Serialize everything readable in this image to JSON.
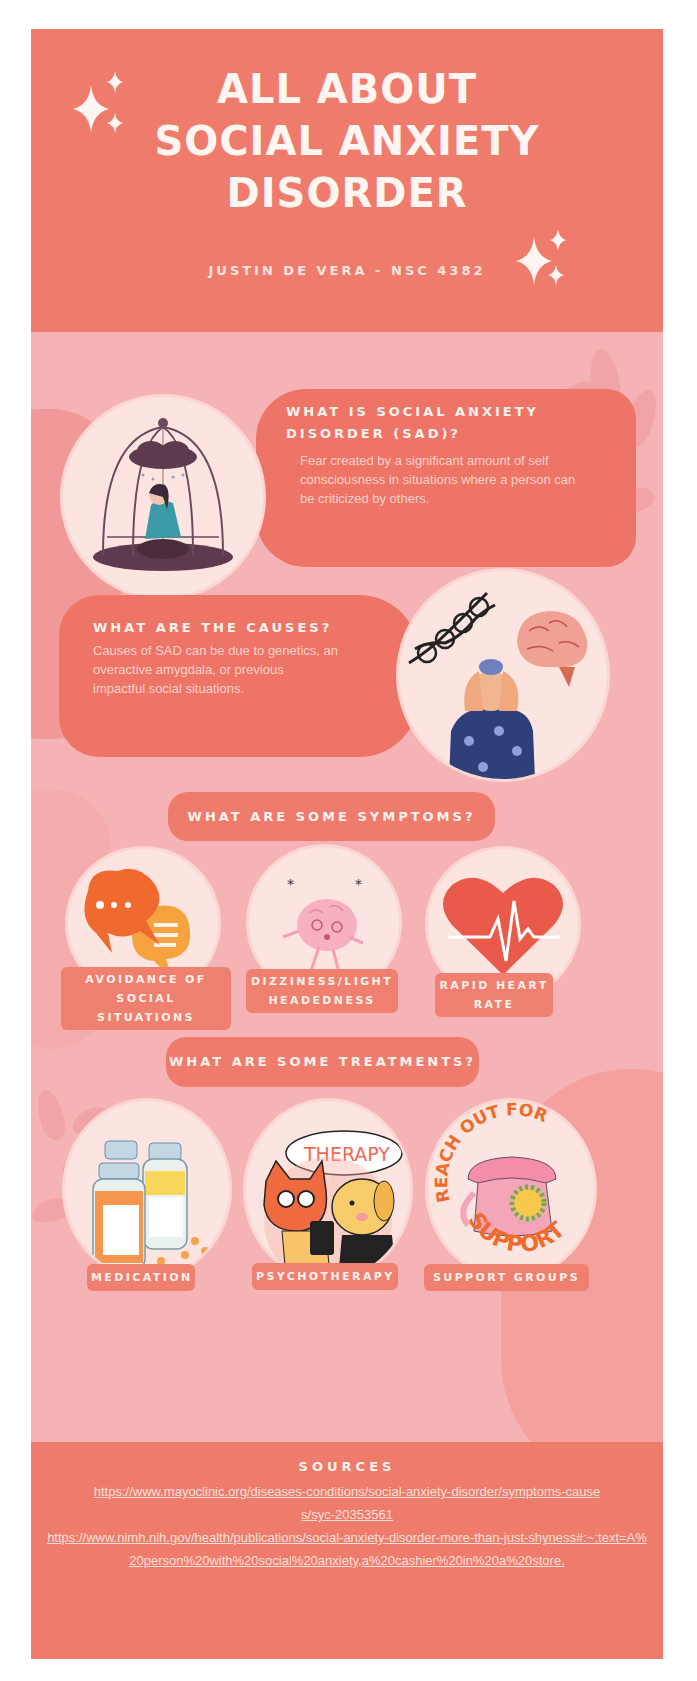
{
  "header": {
    "title_lines": [
      "ALL ABOUT",
      "SOCIAL ANXIETY",
      "DISORDER"
    ],
    "subtitle": "JUSTIN DE VERA - NSC 4382"
  },
  "sections": {
    "what_is": {
      "title": "WHAT IS SOCIAL ANXIETY DISORDER (SAD)?",
      "body": "Fear created by a significant amount of self consciousness in situations where a person can be criticized by others.",
      "illustration": "woman-in-birdcage-with-raincloud"
    },
    "causes": {
      "title": "WHAT ARE THE CAUSES?",
      "body": "Causes of SAD can be due to genetics, an overactive amygdala, or previous impactful social situations.",
      "illustration": "dna-brain-stressed-person"
    },
    "symptoms": {
      "title": "WHAT ARE SOME SYMPTOMS?",
      "items": [
        {
          "label_lines": [
            "AVOIDANCE OF",
            "SOCIAL SITUATIONS"
          ],
          "icon": "speech-bubbles-icon"
        },
        {
          "label_lines": [
            "DIZZINESS/LIGHT",
            "HEADEDNESS"
          ],
          "icon": "dizzy-brain-icon"
        },
        {
          "label_lines": [
            "RAPID HEART",
            "RATE"
          ],
          "icon": "heartbeat-icon"
        }
      ]
    },
    "treatments": {
      "title": "WHAT ARE SOME TREATMENTS?",
      "items": [
        {
          "label": "MEDICATION",
          "icon": "pill-bottles-icon"
        },
        {
          "label": "PSYCHOTHERAPY",
          "icon": "therapy-cat-dog-icon",
          "bubble_text": "THERAPY"
        },
        {
          "label": "SUPPORT GROUPS",
          "icon": "telephone-icon",
          "arc_top": "REACH OUT FOR",
          "arc_bottom": "SUPPORT"
        }
      ]
    }
  },
  "sources": {
    "title": "SOURCES",
    "links": [
      "https://www.mayoclinic.org/diseases-conditions/social-anxiety-disorder/symptoms-causes/syc-20353561",
      "https://www.nimh.nih.gov/health/publications/social-anxiety-disorder-more-than-just-shyness#:~:text=A%20person%20with%20social%20anxiety,a%20cashier%20in%20a%20store."
    ]
  },
  "colors": {
    "header_bg": "#ef7b6d",
    "body_bg": "#f5b3b6",
    "card_bg": "#ee7468",
    "circle_bg": "#fce4e0",
    "text_light": "#fff3ee"
  }
}
